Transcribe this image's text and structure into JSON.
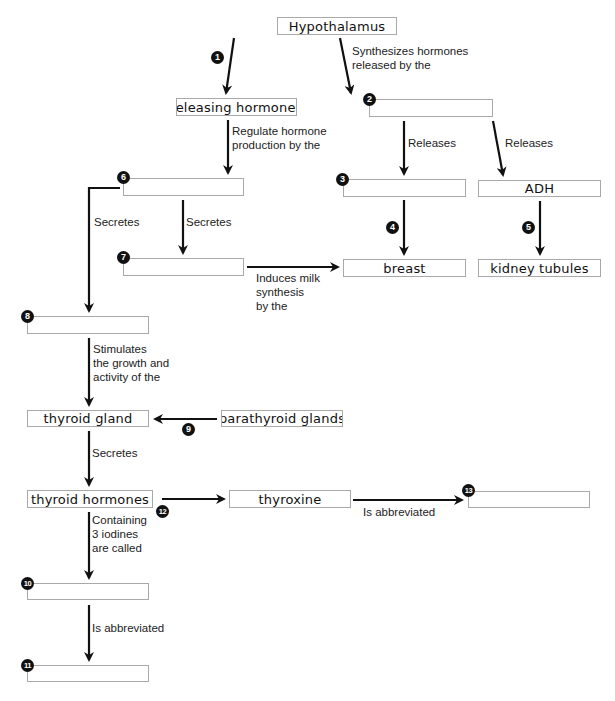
{
  "diagram": {
    "nodes": {
      "hypothalamus": "Hypothalamus",
      "releasing_hormones": "releasing hormones",
      "box2": "",
      "box3": "",
      "adh": "ADH",
      "box6": "",
      "box7": "",
      "breast": "breast",
      "kidney_tubules": "kidney tubules",
      "box8": "",
      "thyroid_gland": "thyroid gland",
      "parathyroid_glands": "parathyroid glands",
      "thyroid_hormones": "thyroid hormones",
      "thyroxine": "thyroxine",
      "box10": "",
      "box11": "",
      "box13": ""
    },
    "edge_labels": {
      "synthesizes_1": "Synthesizes hormones",
      "synthesizes_2": "released by the",
      "regulate_1": "Regulate hormone",
      "regulate_2": "production by the",
      "releases_a": "Releases",
      "releases_b": "Releases",
      "secretes_left": "Secretes",
      "secretes_mid": "Secretes",
      "induces_1": "Induces milk",
      "induces_2": "synthesis",
      "induces_3": "by the",
      "stimulates_1": "Stimulates",
      "stimulates_2": "the growth and",
      "stimulates_3": "activity of the",
      "secretes_thyroid": "Secretes",
      "containing_1": "Containing",
      "containing_2": "3 iodines",
      "containing_3": "are called",
      "abbrev_bottom": "Is abbreviated",
      "abbrev_right": "Is abbreviated"
    },
    "numbers": {
      "n1": "1",
      "n2": "2",
      "n3": "3",
      "n4": "4",
      "n5": "5",
      "n6": "6",
      "n7": "7",
      "n8": "8",
      "n9": "9",
      "n10": "10",
      "n11": "11",
      "n12": "12",
      "n13": "13"
    },
    "colors": {
      "box_border": "#a9a9a9",
      "arrow": "#111111",
      "marker_fill": "#111111",
      "background": "#ffffff"
    }
  }
}
